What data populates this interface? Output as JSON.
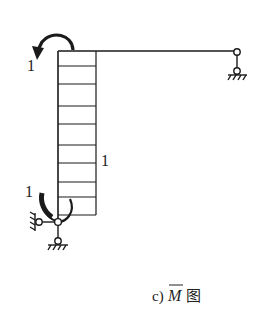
{
  "diagram": {
    "type": "structural-bending-moment-diagram",
    "caption": {
      "prefix": "c)",
      "symbol": "M",
      "overline": true,
      "suffix": "图"
    },
    "labels": {
      "top_moment": "1",
      "bottom_moment": "1",
      "diagram_value": "1"
    },
    "structure": {
      "column": {
        "from": [
          58,
          51
        ],
        "to": [
          58,
          215
        ]
      },
      "beam": {
        "from": [
          58,
          51
        ],
        "to": [
          234,
          51
        ]
      },
      "moment_diagram_rect": {
        "x1": 58,
        "y1": 51,
        "x2": 96,
        "y2": 215
      },
      "hatch_lines_y": [
        66,
        84,
        106,
        124,
        145,
        163,
        182,
        197
      ],
      "supports": [
        {
          "name": "right-roller-link",
          "hinge": [
            237,
            52
          ],
          "base": [
            237,
            71
          ]
        },
        {
          "name": "bottom-left-hinged-links",
          "joint": [
            58,
            222
          ],
          "vertical_base": [
            58,
            241
          ],
          "horizontal_base": [
            39,
            222
          ]
        }
      ],
      "moments": [
        {
          "name": "top-moment-arrow",
          "direction": "counterclockwise",
          "value": "1"
        },
        {
          "name": "bottom-moment-arrow",
          "direction": "counterclockwise",
          "value": "1"
        }
      ]
    },
    "colors": {
      "stroke": "#1a1a1a",
      "background": "#ffffff"
    }
  }
}
